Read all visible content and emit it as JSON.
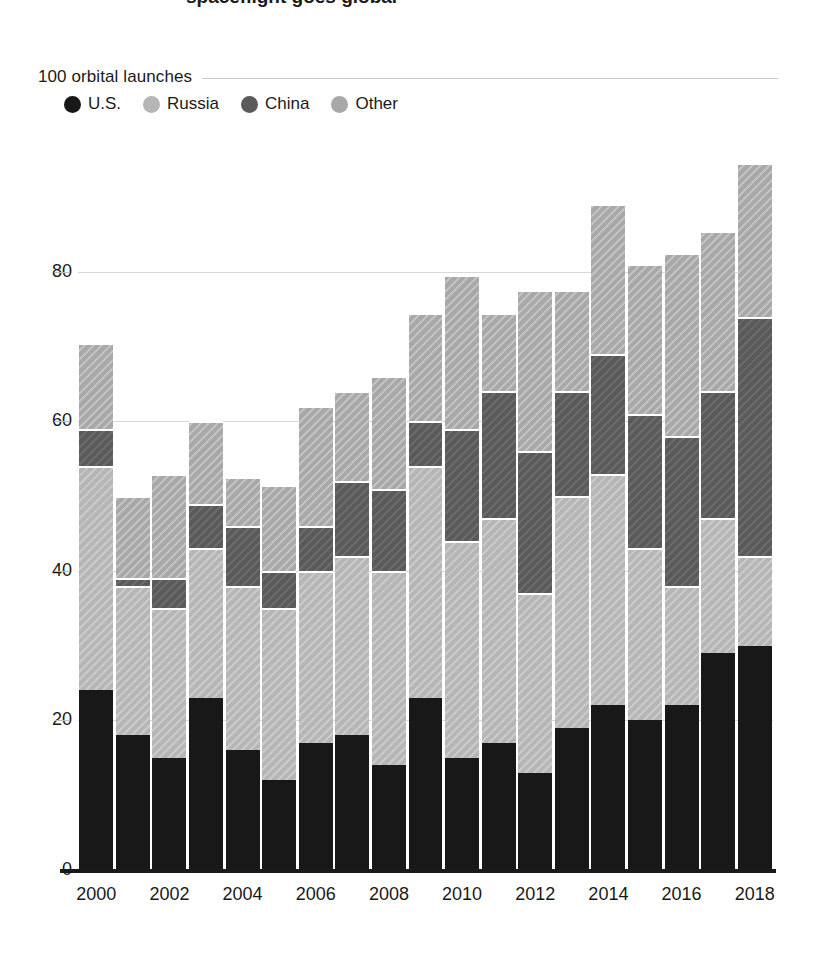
{
  "page": {
    "clipped_title_fragment": "spaceflight goes global"
  },
  "header": {
    "axis_top_label": "100 orbital launches"
  },
  "legend": {
    "items": [
      {
        "label": "U.S.",
        "color": "#181818",
        "key": "us"
      },
      {
        "label": "Russia",
        "color": "#b6b6b6",
        "key": "russia"
      },
      {
        "label": "China",
        "color": "#5a5a5a",
        "key": "china"
      },
      {
        "label": "Other",
        "color": "#a8a8a8",
        "key": "other"
      }
    ]
  },
  "axes": {
    "y_ticks": [
      0,
      20,
      40,
      60,
      80
    ],
    "y_top_tick": 100,
    "y_range": [
      0,
      100
    ],
    "x_tick_labels": [
      "2000",
      "2002",
      "2004",
      "2006",
      "2008",
      "2010",
      "2012",
      "2014",
      "2016",
      "2018"
    ],
    "gridlines": true
  },
  "chart_data": {
    "type": "bar",
    "title": "",
    "subtitle": "",
    "xlabel": "",
    "ylabel": "100 orbital launches",
    "ylim": [
      0,
      100
    ],
    "stacked": true,
    "legend_position": "top-left",
    "categories": [
      "2000",
      "2001",
      "2002",
      "2003",
      "2004",
      "2005",
      "2006",
      "2007",
      "2008",
      "2009",
      "2010",
      "2011",
      "2012",
      "2013",
      "2014",
      "2015",
      "2016",
      "2017",
      "2018"
    ],
    "series": [
      {
        "name": "U.S.",
        "color": "#181818",
        "values": [
          24,
          18,
          15,
          23,
          16,
          12,
          17,
          18,
          14,
          23,
          15,
          17,
          13,
          19,
          22,
          20,
          22,
          29,
          30
        ]
      },
      {
        "name": "Russia",
        "color": "#b6b6b6",
        "values": [
          30,
          20,
          20,
          20,
          22,
          23,
          23,
          24,
          26,
          31,
          29,
          30,
          24,
          31,
          31,
          23,
          16,
          18,
          12
        ]
      },
      {
        "name": "China",
        "color": "#5a5a5a",
        "values": [
          5,
          1,
          4,
          6,
          8,
          5,
          6,
          10,
          11,
          6,
          15,
          17,
          19,
          14,
          16,
          18,
          20,
          17,
          32
        ]
      },
      {
        "name": "Other",
        "color": "#a8a8a8",
        "values": [
          11.5,
          11,
          14,
          11,
          6.5,
          11.5,
          16,
          12,
          15,
          14.5,
          20.5,
          10.5,
          21.5,
          13.5,
          20,
          20,
          24.5,
          21.5,
          20.5
        ]
      }
    ],
    "totals": [
      70.5,
      50,
      53,
      60,
      52.5,
      51.5,
      62,
      64,
      66,
      74.5,
      79.5,
      74.5,
      77.5,
      77.5,
      89,
      81,
      82.5,
      85.5,
      94.5
    ]
  }
}
